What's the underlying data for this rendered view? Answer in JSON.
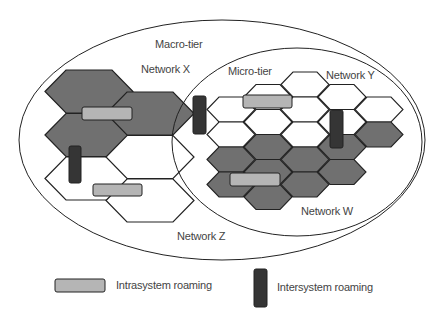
{
  "diagram": {
    "tiers": {
      "macro": "Macro-tier",
      "micro": "Micro-tier"
    },
    "networks": {
      "x": "Network X",
      "y": "Network Y",
      "w": "Network W",
      "z": "Network Z"
    },
    "legend": {
      "intrasystem": "Intrasystem roaming",
      "intersystem": "Intersystem roaming"
    },
    "colors": {
      "network_fill": "#707070",
      "intrasystem_fill": "#b5b5b5",
      "intersystem_fill": "#353535",
      "line": "#222222"
    }
  }
}
